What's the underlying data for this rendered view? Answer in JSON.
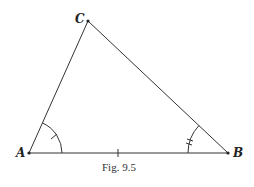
{
  "figure": {
    "caption": "Fig. 9.5",
    "vertices": {
      "A": {
        "label": "A",
        "x": 29,
        "y": 153
      },
      "B": {
        "label": "B",
        "x": 228,
        "y": 153
      },
      "C": {
        "label": "C",
        "x": 88,
        "y": 21
      }
    },
    "markings": {
      "angle_A": "single tick arc",
      "angle_B": "double tick arc",
      "side_AB": "single tick"
    },
    "colors": {
      "line": "#333333",
      "background": "#ffffff"
    }
  }
}
